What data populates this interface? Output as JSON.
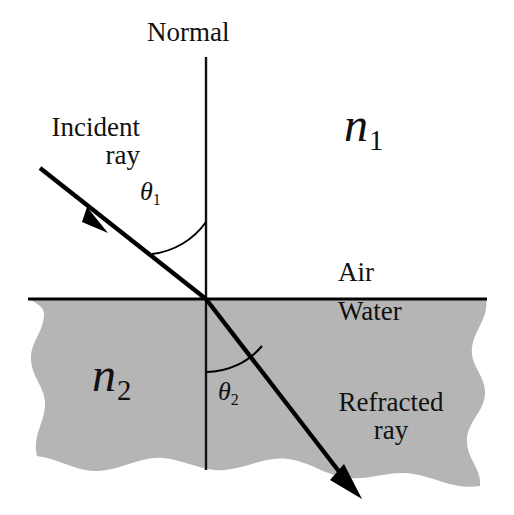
{
  "diagram": {
    "type": "physics-ray-diagram",
    "canvas": {
      "width": 514,
      "height": 515
    },
    "colors": {
      "background": "#ffffff",
      "water_fill": "#b5b5b5",
      "ink": "#111111",
      "line": "#000000"
    },
    "labels": {
      "normal": "Normal",
      "incident_ray_line1": "Incident",
      "incident_ray_line2": "ray",
      "refracted_ray_line1": "Refracted",
      "refracted_ray_line2": "ray",
      "air": "Air",
      "water": "Water",
      "n1_symbol": "n",
      "n1_subscript": "1",
      "n2_symbol": "n",
      "n2_subscript": "2",
      "theta1_symbol": "θ",
      "theta1_subscript": "1",
      "theta2_symbol": "θ",
      "theta2_subscript": "2"
    },
    "geometry": {
      "interface_y": 299,
      "incidence_point": {
        "x": 206,
        "y": 299
      },
      "normal_top_y": 57,
      "normal_bottom_y": 470,
      "incident_ray_start": {
        "x": 40,
        "y": 168
      },
      "incident_arrow_tip": {
        "x": 106,
        "y": 232
      },
      "refracted_arrow_tip": {
        "x": 360,
        "y": 497
      },
      "theta1_degrees": 44,
      "theta2_degrees": 32
    }
  }
}
